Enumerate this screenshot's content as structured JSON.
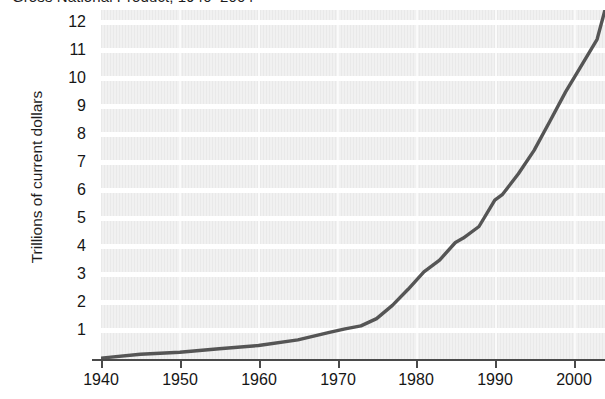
{
  "chart_data": {
    "type": "line",
    "title": "Gross National Product, 1940–2004",
    "xlabel": "",
    "ylabel": "Trillions of current dollars",
    "xlim": [
      1940,
      2004
    ],
    "ylim": [
      0,
      12
    ],
    "grid": true,
    "legend": false,
    "legend_position": "none",
    "x_ticks": [
      1940,
      1950,
      1960,
      1970,
      1980,
      1990,
      2000
    ],
    "x_tick_labels": [
      "1940",
      "1950",
      "1960",
      "1970",
      "1980",
      "1990",
      "2000"
    ],
    "y_ticks": [
      1,
      2,
      3,
      4,
      5,
      6,
      7,
      8,
      9,
      10,
      11,
      12
    ],
    "y_tick_labels": [
      "1",
      "2",
      "3",
      "4",
      "5",
      "6",
      "7",
      "8",
      "9",
      "10",
      "11",
      "12"
    ],
    "series": [
      {
        "name": "Gross National Product",
        "color": "#555555",
        "x": [
          1940,
          1945,
          1950,
          1955,
          1960,
          1965,
          1969,
          1971,
          1973,
          1975,
          1977,
          1979,
          1981,
          1983,
          1985,
          1986,
          1988,
          1990,
          1991,
          1993,
          1995,
          1997,
          1999,
          2001,
          2003,
          2004
        ],
        "values": [
          0.1,
          0.23,
          0.3,
          0.42,
          0.53,
          0.72,
          0.98,
          1.1,
          1.2,
          1.45,
          1.9,
          2.45,
          3.05,
          3.45,
          4.05,
          4.2,
          4.6,
          5.5,
          5.7,
          6.4,
          7.2,
          8.2,
          9.2,
          10.1,
          11.0,
          12.0
        ]
      }
    ]
  }
}
